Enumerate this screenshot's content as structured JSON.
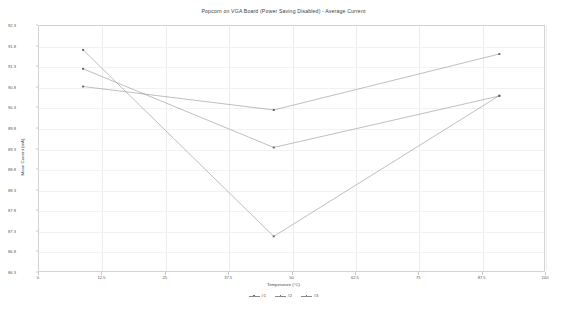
{
  "chart_data": {
    "type": "line",
    "title": "Popcorn on VGA Board (Power Saving Disabled) - Average Current",
    "xlabel": "Temperature (°C)",
    "ylabel": "Mean Current (mA)",
    "xlim": [
      0,
      100
    ],
    "ylim": [
      86.3,
      92.3
    ],
    "grid": true,
    "legend_position": "bottom",
    "xticks": [
      0,
      12.5,
      25,
      37.5,
      50,
      62.5,
      75,
      87.5,
      100
    ],
    "xtick_labels": [
      "0",
      "12.5",
      "25",
      "37.5",
      "50",
      "62.5",
      "75",
      "87.5",
      "100"
    ],
    "yticks": [
      86.3,
      86.8,
      87.3,
      87.8,
      88.3,
      88.8,
      89.3,
      89.8,
      90.3,
      90.8,
      91.3,
      91.8,
      92.3
    ],
    "ytick_labels": [
      "86.3",
      "86.8",
      "87.3",
      "87.8",
      "88.3",
      "88.8",
      "89.3",
      "89.8",
      "90.3",
      "90.8",
      "91.3",
      "91.8",
      "92.3"
    ],
    "x": [
      8.7,
      46.3,
      90.8
    ],
    "series": [
      {
        "name": "#1",
        "values": [
          91.72,
          87.19,
          90.61
        ]
      },
      {
        "name": "#2",
        "values": [
          91.26,
          89.35,
          90.6
        ]
      },
      {
        "name": "#3",
        "values": [
          90.83,
          90.26,
          91.62
        ]
      }
    ],
    "line_color": "#8a8a8a",
    "marker_color": "#5f5f5f",
    "grid_color": "#ececec",
    "frame_color": "#d2d2d2"
  },
  "legend": {
    "items": [
      {
        "label": "#1"
      },
      {
        "label": "#2"
      },
      {
        "label": "#3"
      }
    ]
  }
}
